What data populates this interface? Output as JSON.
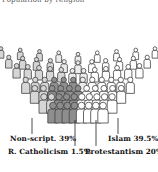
{
  "title": "Population by religion",
  "chart_data": {
    "type": "pie",
    "style": "pictogram-crowd (semicircle of people icons)",
    "title": "Population by religion",
    "categories": [
      "Non-script.",
      "R. Catholicism",
      "Protestantism",
      "Islam"
    ],
    "values": [
      39,
      1.5,
      20,
      39.5
    ],
    "unit": "%",
    "colors": [
      "#d6d6d6",
      "#8e8e8e",
      "#ececec",
      "#ffffff"
    ],
    "legend": "callout labels below figure"
  },
  "labels": {
    "nonscript": "Non-script. 39%",
    "catholic": "R. Catholicism 1.5%",
    "protestant": "Protestantism 20%",
    "islam": "Islam 39.5%"
  }
}
